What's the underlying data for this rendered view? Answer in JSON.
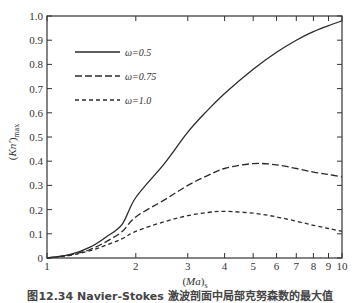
{
  "chart_data": {
    "type": "line",
    "title": "",
    "xlabel": "(Ma)s",
    "ylabel": "(Kn')max",
    "xscale": "log",
    "xlim": [
      1,
      10
    ],
    "ylim": [
      0,
      1.0
    ],
    "grid": false,
    "legend_position": "upper-left",
    "xticks": [
      1,
      2,
      3,
      4,
      5,
      6,
      7,
      8,
      9,
      10
    ],
    "xtick_labels": [
      "1",
      "2",
      "3",
      "4",
      "5",
      "6",
      "7",
      "8",
      "9",
      "10"
    ],
    "yticks": [
      0,
      0.1,
      0.2,
      0.3,
      0.4,
      0.5,
      0.6,
      0.7,
      0.8,
      0.9,
      1.0
    ],
    "ytick_labels": [
      "0",
      "0.1",
      "0.2",
      "0.3",
      "0.4",
      "0.5",
      "0.6",
      "0.7",
      "0.8",
      "0.9",
      "1.0"
    ],
    "x": [
      1.0,
      1.2,
      1.4,
      1.6,
      1.8,
      2.0,
      2.5,
      3.0,
      3.5,
      4.0,
      5.0,
      6.0,
      7.0,
      8.0,
      9.0,
      10.0
    ],
    "series": [
      {
        "name": "ω=0.5",
        "style": "solid",
        "values": [
          0.0,
          0.015,
          0.045,
          0.09,
          0.14,
          0.25,
          0.39,
          0.52,
          0.61,
          0.68,
          0.78,
          0.85,
          0.9,
          0.935,
          0.96,
          0.98
        ]
      },
      {
        "name": "ω=0.75",
        "style": "dashed",
        "values": [
          0.0,
          0.013,
          0.035,
          0.07,
          0.11,
          0.17,
          0.24,
          0.3,
          0.34,
          0.37,
          0.39,
          0.385,
          0.37,
          0.355,
          0.345,
          0.335
        ]
      },
      {
        "name": "ω=1.0",
        "style": "dotted",
        "values": [
          0.0,
          0.011,
          0.03,
          0.055,
          0.08,
          0.11,
          0.15,
          0.175,
          0.188,
          0.193,
          0.185,
          0.17,
          0.152,
          0.135,
          0.122,
          0.11
        ]
      }
    ]
  },
  "legend": [
    {
      "label": "ω=0.5",
      "style": "solid"
    },
    {
      "label": "ω=0.75",
      "style": "dashed"
    },
    {
      "label": "ω=1.0",
      "style": "dotted"
    }
  ],
  "axes": {
    "xlabel": "(Ma)s",
    "ylabel": "(Kn')max"
  },
  "caption": "图12.34  Navier-Stokes 激波剖面中局部克努森数的最大值"
}
